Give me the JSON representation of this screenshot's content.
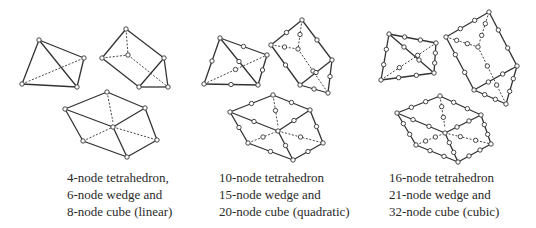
{
  "style": {
    "stroke": "#333333",
    "node_fill": "#ffffff",
    "node_radius": 2.2
  },
  "groups": [
    {
      "name": "linear",
      "caption": [
        "4-node tetrahedron,",
        "6-node wedge and",
        "8-node cube (linear)"
      ],
      "shapes": [
        {
          "name": "tetrahedron-4",
          "vertices": {
            "A": [
              39,
              40
            ],
            "B": [
              84,
              58
            ],
            "C": [
              22,
              84
            ],
            "D": [
              77,
              87
            ]
          },
          "solid": [
            [
              "A",
              "B"
            ],
            [
              "A",
              "C"
            ],
            [
              "A",
              "D"
            ],
            [
              "C",
              "D"
            ],
            [
              "B",
              "D"
            ]
          ],
          "dashed": [
            [
              "C",
              "B"
            ]
          ],
          "order": 1
        },
        {
          "name": "wedge-6",
          "vertices": {
            "T": [
              126,
              29
            ],
            "L": [
              102,
              58
            ],
            "I": [
              128,
              55
            ],
            "R": [
              164,
              58
            ],
            "BL": [
              139,
              87
            ],
            "BR": [
              168,
              87
            ]
          },
          "solid": [
            [
              "T",
              "L"
            ],
            [
              "T",
              "R"
            ],
            [
              "L",
              "BL"
            ],
            [
              "BL",
              "R"
            ],
            [
              "BL",
              "BR"
            ],
            [
              "R",
              "BR"
            ]
          ],
          "dashed": [
            [
              "T",
              "I"
            ],
            [
              "L",
              "I"
            ],
            [
              "I",
              "BR"
            ]
          ],
          "order": 1
        },
        {
          "name": "cube-8",
          "vertices": {
            "T": [
              107,
              92
            ],
            "L": [
              65,
              109
            ],
            "R": [
              145,
              108
            ],
            "CT": [
              113,
              122
            ],
            "C": [
              113,
              127
            ],
            "BL": [
              83,
              141
            ],
            "RL": [
              157,
              140
            ],
            "B": [
              127,
              157
            ]
          },
          "solid": [
            [
              "L",
              "T"
            ],
            [
              "T",
              "R"
            ],
            [
              "R",
              "RL"
            ],
            [
              "RL",
              "B"
            ],
            [
              "B",
              "BL"
            ],
            [
              "BL",
              "L"
            ],
            [
              "L",
              "C"
            ],
            [
              "C",
              "R"
            ],
            [
              "C",
              "B"
            ]
          ],
          "dashed": [
            [
              "T",
              "CT"
            ],
            [
              "BL",
              "C"
            ],
            [
              "C",
              "RL"
            ]
          ],
          "order": 1
        }
      ]
    },
    {
      "name": "quadratic",
      "caption": [
        "10-node tetrahedron",
        "15-node wedge and",
        "20-node cube (quadratic)"
      ],
      "shapes": [
        {
          "name": "tetrahedron-10",
          "vertices": {
            "A": [
              220,
              38
            ],
            "B": [
              267,
              55
            ],
            "C": [
              204,
              84
            ],
            "D": [
              258,
              85
            ]
          },
          "solid": [
            [
              "A",
              "B"
            ],
            [
              "A",
              "C"
            ],
            [
              "A",
              "D"
            ],
            [
              "C",
              "D"
            ],
            [
              "B",
              "D"
            ]
          ],
          "dashed": [
            [
              "C",
              "B"
            ]
          ],
          "order": 2
        },
        {
          "name": "wedge-15",
          "vertices": {
            "T": [
              302,
              20
            ],
            "L": [
              271,
              45
            ],
            "I": [
              298,
              49
            ],
            "R": [
              332,
              60
            ],
            "BL": [
              300,
              85
            ],
            "BR": [
              328,
              93
            ],
            "J": [
              313,
              71
            ]
          },
          "solid": [
            [
              "T",
              "L"
            ],
            [
              "T",
              "R"
            ],
            [
              "L",
              "BL"
            ],
            [
              "BL",
              "R"
            ],
            [
              "BL",
              "BR"
            ],
            [
              "R",
              "BR"
            ]
          ],
          "dashed": [
            [
              "T",
              "I"
            ],
            [
              "L",
              "I"
            ],
            [
              "I",
              "BR"
            ]
          ],
          "order": 2
        },
        {
          "name": "cube-20",
          "vertices": {
            "T": [
              273,
              95
            ],
            "L": [
              230,
              112
            ],
            "R": [
              310,
              110
            ],
            "CT": [
              278,
              126
            ],
            "C": [
              278,
              131
            ],
            "BL": [
              248,
              143
            ],
            "RL": [
              323,
              143
            ],
            "B": [
              293,
              160
            ]
          },
          "solid": [
            [
              "L",
              "T"
            ],
            [
              "T",
              "R"
            ],
            [
              "R",
              "RL"
            ],
            [
              "RL",
              "B"
            ],
            [
              "B",
              "BL"
            ],
            [
              "BL",
              "L"
            ],
            [
              "L",
              "C"
            ],
            [
              "C",
              "R"
            ],
            [
              "C",
              "B"
            ]
          ],
          "dashed": [
            [
              "T",
              "CT"
            ],
            [
              "BL",
              "C"
            ],
            [
              "C",
              "RL"
            ]
          ],
          "order": 2
        }
      ]
    },
    {
      "name": "cubic",
      "caption": [
        "16-node tetrahedron",
        "21-node wedge and",
        "32-node cube (cubic)"
      ],
      "shapes": [
        {
          "name": "tetrahedron-16",
          "vertices": {
            "A": [
              389,
              34
            ],
            "B": [
              436,
              43
            ],
            "C": [
              381,
              80
            ],
            "D": [
              434,
              73
            ]
          },
          "solid": [
            [
              "A",
              "B"
            ],
            [
              "A",
              "C"
            ],
            [
              "A",
              "D"
            ],
            [
              "C",
              "D"
            ],
            [
              "B",
              "D"
            ]
          ],
          "dashed": [
            [
              "C",
              "B"
            ]
          ],
          "order": 3
        },
        {
          "name": "wedge-21",
          "vertices": {
            "T": [
              489,
              12
            ],
            "L": [
              446,
              37
            ],
            "I": [
              478,
              47
            ],
            "R": [
              517,
              66
            ],
            "BL": [
              474,
              90
            ],
            "BR": [
              506,
              104
            ]
          },
          "solid": [
            [
              "T",
              "L"
            ],
            [
              "T",
              "R"
            ],
            [
              "L",
              "BL"
            ],
            [
              "BL",
              "R"
            ],
            [
              "BL",
              "BR"
            ],
            [
              "R",
              "BR"
            ]
          ],
          "dashed": [
            [
              "T",
              "I"
            ],
            [
              "L",
              "I"
            ],
            [
              "I",
              "BR"
            ]
          ],
          "order": 3
        },
        {
          "name": "cube-32",
          "vertices": {
            "T": [
              440,
              96
            ],
            "L": [
              397,
              113
            ],
            "R": [
              481,
              115
            ],
            "CT": [
              445,
              128
            ],
            "C": [
              445,
              133
            ],
            "BL": [
              416,
              145
            ],
            "RL": [
              491,
              144
            ],
            "B": [
              458,
              162
            ]
          },
          "solid": [
            [
              "L",
              "T"
            ],
            [
              "T",
              "R"
            ],
            [
              "R",
              "RL"
            ],
            [
              "RL",
              "B"
            ],
            [
              "B",
              "BL"
            ],
            [
              "BL",
              "L"
            ],
            [
              "L",
              "C"
            ],
            [
              "C",
              "R"
            ],
            [
              "C",
              "B"
            ]
          ],
          "dashed": [
            [
              "T",
              "CT"
            ],
            [
              "BL",
              "C"
            ],
            [
              "C",
              "RL"
            ]
          ],
          "order": 3
        }
      ]
    }
  ]
}
